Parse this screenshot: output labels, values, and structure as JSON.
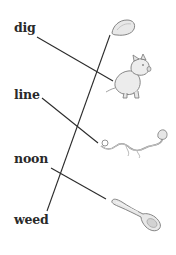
{
  "exercise": {
    "type": "word-picture matching",
    "words": [
      {
        "label": "dig",
        "x": 14,
        "y": 22
      },
      {
        "label": "line",
        "x": 14,
        "y": 89
      },
      {
        "label": "noon",
        "x": 14,
        "y": 153
      },
      {
        "label": "weed",
        "x": 14,
        "y": 214
      }
    ],
    "pictures": [
      {
        "name": "seed",
        "description": "seed"
      },
      {
        "name": "pig",
        "description": "pig"
      },
      {
        "name": "vine",
        "description": "vine"
      },
      {
        "name": "spoon",
        "description": "spoon"
      }
    ],
    "matches": [
      {
        "word": "dig",
        "picture": "pig"
      },
      {
        "word": "line",
        "picture": "vine"
      },
      {
        "word": "noon",
        "picture": "spoon"
      },
      {
        "word": "weed",
        "picture": "seed"
      }
    ],
    "colors": {
      "text": "#2a2a2a",
      "line": "#2b2b2b",
      "picture_fill": "#e6e6e6",
      "picture_stroke": "#7a7a7a",
      "background": "#ffffff"
    }
  }
}
